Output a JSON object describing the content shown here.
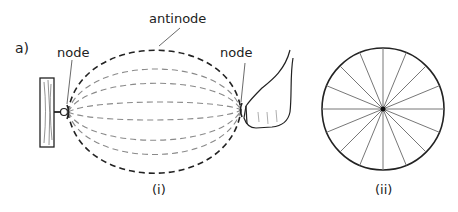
{
  "figure": {
    "part_label": "a)",
    "labels": {
      "node_left": "node",
      "node_right": "node",
      "antinode": "antinode"
    },
    "captions": {
      "left": "(i)",
      "right": "(ii)"
    },
    "colors": {
      "outer_envelope": "#222222",
      "inner_modes": "#8a8a8a",
      "outline": "#222222",
      "spokes": "#777777"
    },
    "standing_wave": {
      "left_node": [
        68,
        112
      ],
      "right_node": [
        241,
        110
      ],
      "envelope_amplitude": 62,
      "inner_amplitudes": [
        44,
        30,
        9
      ]
    },
    "end_view": {
      "center": [
        383,
        109
      ],
      "radius": 61,
      "spoke_count": 16
    }
  }
}
